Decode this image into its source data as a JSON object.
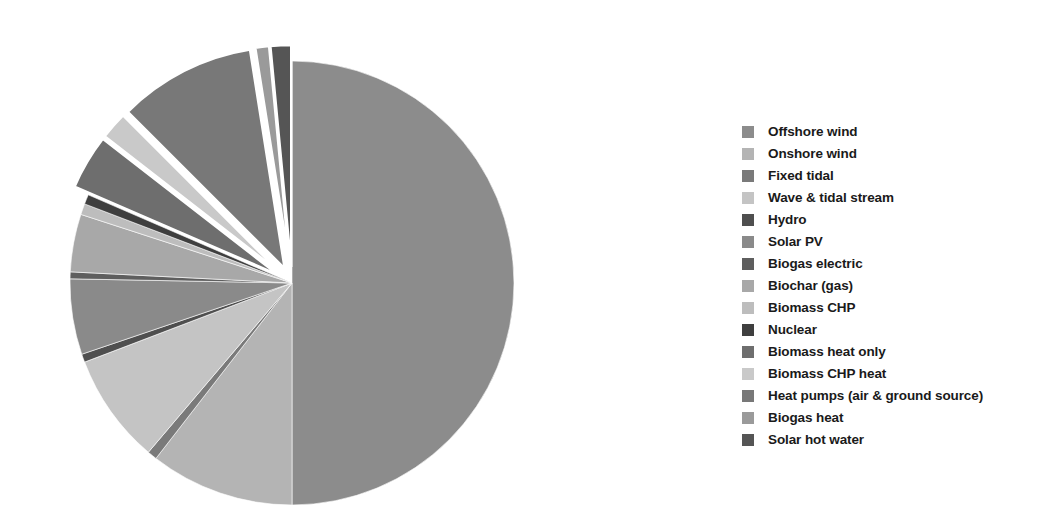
{
  "chart_data": {
    "type": "pie",
    "title": "",
    "subtitle": "",
    "xlabel": "",
    "ylabel": "",
    "grid": false,
    "legend_position": "right",
    "center": {
      "x": 292,
      "y": 283
    },
    "radius": 222,
    "start_angle_deg": 0,
    "direction": "clockwise",
    "categories": [
      "Offshore wind",
      "Onshore wind",
      "Fixed tidal",
      "Wave & tidal stream",
      "Hydro",
      "Solar PV",
      "Biogas electric",
      "Biochar (gas)",
      "Biomass CHP",
      "Nuclear",
      "Biomass heat only",
      "Biomass CHP heat",
      "Heat pumps (air & ground source)",
      "Biogas heat",
      "Solar hot water"
    ],
    "values": [
      50.0,
      10.5,
      0.7,
      8.0,
      0.6,
      5.5,
      0.5,
      4.2,
      0.8,
      0.7,
      4.0,
      2.0,
      10.0,
      1.0,
      1.5
    ],
    "units": "percent",
    "slices": [
      {
        "label": "Offshore wind",
        "value": 50.0,
        "color": "#8c8c8c",
        "exploded": false
      },
      {
        "label": "Onshore wind",
        "value": 10.5,
        "color": "#b4b4b4",
        "exploded": false
      },
      {
        "label": "Fixed tidal",
        "value": 0.7,
        "color": "#7a7a7a",
        "exploded": false
      },
      {
        "label": "Wave & tidal stream",
        "value": 8.0,
        "color": "#c4c4c4",
        "exploded": false
      },
      {
        "label": "Hydro",
        "value": 0.6,
        "color": "#4f4f4f",
        "exploded": false
      },
      {
        "label": "Solar PV",
        "value": 5.5,
        "color": "#8a8a8a",
        "exploded": false
      },
      {
        "label": "Biogas electric",
        "value": 0.5,
        "color": "#5e5e5e",
        "exploded": false
      },
      {
        "label": "Biochar (gas)",
        "value": 4.2,
        "color": "#a8a8a8",
        "exploded": false
      },
      {
        "label": "Biomass CHP",
        "value": 0.8,
        "color": "#bdbdbd",
        "exploded": false
      },
      {
        "label": "Nuclear",
        "value": 0.7,
        "color": "#3f3f3f",
        "exploded": false
      },
      {
        "label": "Biomass heat only",
        "value": 4.0,
        "color": "#6e6e6e",
        "exploded": true
      },
      {
        "label": "Biomass CHP heat",
        "value": 2.0,
        "color": "#c9c9c9",
        "exploded": true
      },
      {
        "label": "Heat pumps (air & ground source)",
        "value": 10.0,
        "color": "#787878",
        "exploded": true
      },
      {
        "label": "Biogas heat",
        "value": 1.0,
        "color": "#9a9a9a",
        "exploded": true
      },
      {
        "label": "Solar hot water",
        "value": 1.5,
        "color": "#555555",
        "exploded": true
      }
    ]
  },
  "legend": {
    "items": [
      {
        "label": "Offshore wind",
        "color": "#8c8c8c"
      },
      {
        "label": "Onshore wind",
        "color": "#b4b4b4"
      },
      {
        "label": "Fixed tidal",
        "color": "#7a7a7a"
      },
      {
        "label": "Wave & tidal stream",
        "color": "#c4c4c4"
      },
      {
        "label": "Hydro",
        "color": "#4f4f4f"
      },
      {
        "label": "Solar PV",
        "color": "#8a8a8a"
      },
      {
        "label": "Biogas electric",
        "color": "#5e5e5e"
      },
      {
        "label": "Biochar (gas)",
        "color": "#a8a8a8"
      },
      {
        "label": "Biomass CHP",
        "color": "#bdbdbd"
      },
      {
        "label": "Nuclear",
        "color": "#3f3f3f"
      },
      {
        "label": "Biomass heat only",
        "color": "#6e6e6e"
      },
      {
        "label": "Biomass CHP heat",
        "color": "#c9c9c9"
      },
      {
        "label": "Heat pumps (air & ground source)",
        "color": "#787878"
      },
      {
        "label": "Biogas heat",
        "color": "#9a9a9a"
      },
      {
        "label": "Solar hot water",
        "color": "#555555"
      }
    ]
  }
}
